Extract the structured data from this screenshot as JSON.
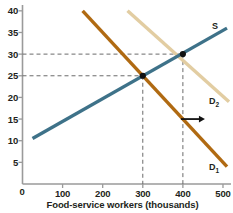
{
  "chart_data": {
    "type": "line",
    "title": "",
    "xlabel": "Food-service workers (thousands)",
    "ylabel": "",
    "xlim": [
      0,
      520
    ],
    "ylim": [
      0,
      41
    ],
    "xticks": [
      "0",
      "100",
      "200",
      "300",
      "400",
      "500"
    ],
    "xtick_values": [
      0,
      100,
      200,
      300,
      400,
      500
    ],
    "yticks": [
      "5",
      "10",
      "15",
      "20",
      "25",
      "30",
      "35",
      "40"
    ],
    "ytick_values": [
      5,
      10,
      15,
      20,
      25,
      30,
      35,
      40
    ],
    "grid": false,
    "legend_position": "inline-right",
    "series": [
      {
        "name": "S",
        "label": "S",
        "color": "#3e7289",
        "kind": "supply",
        "points": [
          [
            25,
            10.5
          ],
          [
            510,
            36.0
          ]
        ]
      },
      {
        "name": "D1",
        "label": "D",
        "sub": "1",
        "color": "#b06a12",
        "kind": "demand",
        "points": [
          [
            150,
            40.0
          ],
          [
            510,
            4.0
          ]
        ]
      },
      {
        "name": "D2",
        "label": "D",
        "sub": "2",
        "color": "#e2cda2",
        "kind": "demand",
        "points": [
          [
            262,
            40.0
          ],
          [
            515,
            19.0
          ]
        ]
      }
    ],
    "equilibria": [
      {
        "name": "E1",
        "x": 300,
        "y": 25
      },
      {
        "name": "E2",
        "x": 400,
        "y": 30
      }
    ],
    "guides": [
      {
        "y": 25,
        "x": 300
      },
      {
        "y": 30,
        "x": 400
      }
    ],
    "annotations": [
      {
        "name": "shift-arrow",
        "type": "arrow",
        "direction": "right",
        "x0": 395,
        "x1": 455,
        "y": 15
      }
    ]
  },
  "labels": {
    "supply": "S",
    "demand1_base": "D",
    "demand1_sub": "1",
    "demand2_base": "D",
    "demand2_sub": "2"
  },
  "axis": {
    "x_title": "Food-service workers (thousands)",
    "origin_label": "0"
  }
}
